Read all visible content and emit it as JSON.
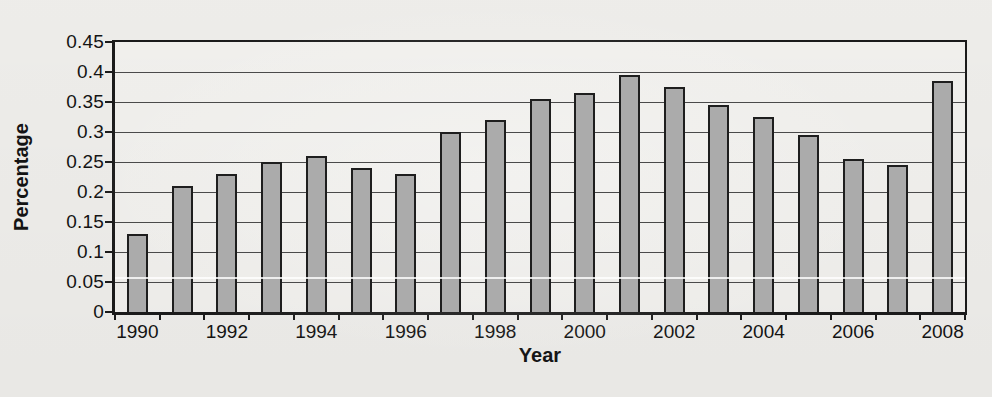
{
  "page": {
    "background_color": "#f2f1ee",
    "text_color": "#141414"
  },
  "chart_data": {
    "type": "bar",
    "title": "",
    "xlabel": "Year",
    "ylabel": "Percentage",
    "categories": [
      "1990",
      "1991",
      "1992",
      "1993",
      "1994",
      "1995",
      "1996",
      "1997",
      "1998",
      "1999",
      "2000",
      "2001",
      "2002",
      "2003",
      "2004",
      "2005",
      "2006",
      "2007",
      "2008"
    ],
    "values": [
      0.13,
      0.21,
      0.23,
      0.25,
      0.26,
      0.24,
      0.23,
      0.3,
      0.32,
      0.355,
      0.365,
      0.395,
      0.375,
      0.345,
      0.325,
      0.295,
      0.255,
      0.245,
      0.385
    ],
    "ylim": [
      0,
      0.45
    ],
    "y_tick_step": 0.05,
    "y_tick_labels": [
      "0",
      "0.05",
      "0.1",
      "0.15",
      "0.2",
      "0.25",
      "0.3",
      "0.35",
      "0.4",
      "0.45"
    ],
    "x_tick_labels": [
      "1990",
      "1992",
      "1994",
      "1996",
      "1998",
      "2000",
      "2002",
      "2004",
      "2006",
      "2008"
    ],
    "grid": "horizontal",
    "legend": "none",
    "bar_fill": "#ababab",
    "bar_border": "#1e1e1e",
    "grid_color": "#4a4a4a",
    "frame_color": "#1b1b1b"
  }
}
